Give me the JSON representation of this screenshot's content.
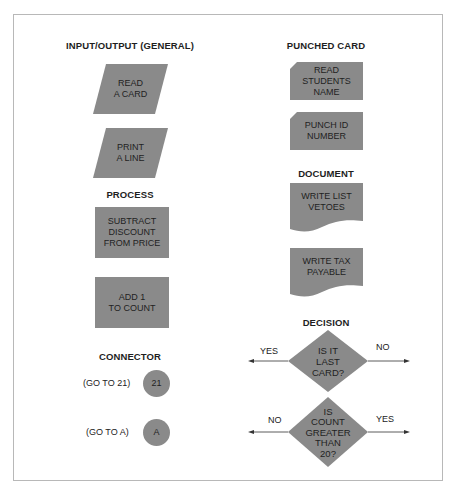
{
  "colors": {
    "shape_fill": "#8a8a8a",
    "frame": "#b8b8b8",
    "text": "#1f1f1f"
  },
  "sections": {
    "io": {
      "title": "INPUT/OUTPUT (GENERAL)",
      "shapes": [
        {
          "type": "parallelogram",
          "lines": [
            "READ",
            "A CARD"
          ]
        },
        {
          "type": "parallelogram",
          "lines": [
            "PRINT",
            "A LINE"
          ]
        }
      ]
    },
    "process": {
      "title": "PROCESS",
      "shapes": [
        {
          "type": "rectangle",
          "lines": [
            "SUBTRACT",
            "DISCOUNT",
            "FROM PRICE"
          ]
        },
        {
          "type": "rectangle",
          "lines": [
            "ADD 1",
            "TO COUNT"
          ]
        }
      ]
    },
    "connector": {
      "title": "CONNECTOR",
      "items": [
        {
          "caption": "(GO TO 21)",
          "symbol": "21"
        },
        {
          "caption": "(GO TO A)",
          "symbol": "A"
        }
      ]
    },
    "punched_card": {
      "title": "PUNCHED CARD",
      "shapes": [
        {
          "type": "punched-card",
          "lines": [
            "READ",
            "STUDENTS",
            "NAME"
          ]
        },
        {
          "type": "punched-card",
          "lines": [
            "PUNCH ID",
            "NUMBER"
          ]
        }
      ]
    },
    "document": {
      "title": "DOCUMENT",
      "shapes": [
        {
          "type": "document",
          "lines": [
            "WRITE LIST",
            "VETOES"
          ]
        },
        {
          "type": "document",
          "lines": [
            "WRITE TAX",
            "PAYABLE"
          ]
        }
      ]
    },
    "decision": {
      "title": "DECISION",
      "items": [
        {
          "lines": [
            "IS IT",
            "LAST",
            "CARD?"
          ],
          "left_branch": "YES",
          "right_branch": "NO"
        },
        {
          "lines": [
            "IS",
            "COUNT",
            "GREATER",
            "THAN",
            "20?"
          ],
          "left_branch": "NO",
          "right_branch": "YES"
        }
      ]
    }
  }
}
